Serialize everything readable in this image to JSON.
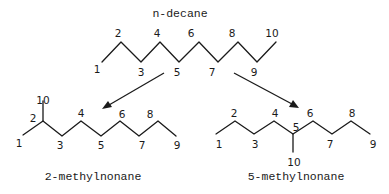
{
  "diagram": {
    "type": "chemical-structure-transformation",
    "molecules": {
      "top": {
        "name": "n-decane",
        "atom_numbers": [
          "1",
          "2",
          "3",
          "4",
          "5",
          "6",
          "7",
          "8",
          "9",
          "10"
        ]
      },
      "left": {
        "name": "2-methylnonane",
        "atom_numbers": [
          "1",
          "2",
          "3",
          "4",
          "5",
          "6",
          "7",
          "8",
          "9",
          "10"
        ],
        "methyl_on_carbon": "2"
      },
      "right": {
        "name": "5-methylnonane",
        "atom_numbers": [
          "1",
          "2",
          "3",
          "4",
          "5",
          "6",
          "7",
          "8",
          "9",
          "10"
        ],
        "methyl_on_carbon": "5"
      }
    },
    "arrows": [
      {
        "from": "n-decane",
        "to": "2-methylnonane"
      },
      {
        "from": "n-decane",
        "to": "5-methylnonane"
      }
    ],
    "colors": {
      "line": "#1a1a1a",
      "background": "#ffffff"
    }
  }
}
